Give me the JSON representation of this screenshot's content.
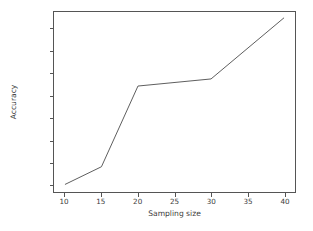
{
  "chart_data": {
    "type": "line",
    "title": "",
    "xlabel": "Sampling size",
    "ylabel": "Accuracy",
    "x": [
      10,
      15,
      20,
      30,
      40
    ],
    "values": [
      84.2,
      84.22,
      84.311,
      84.319,
      84.388
    ],
    "series": [
      {
        "name": "accuracy",
        "x": [
          10,
          15,
          20,
          30,
          40
        ],
        "values": [
          84.2,
          84.22,
          84.311,
          84.319,
          84.388
        ]
      }
    ],
    "xlim": [
      8.5,
      41.5
    ],
    "ylim": [
      84.1915,
      84.3945
    ],
    "xticks": [
      10,
      15,
      20,
      25,
      30,
      35,
      40
    ],
    "xtick_labels": [
      "10",
      "15",
      "20",
      "25",
      "30",
      "35",
      "40"
    ],
    "yticks": [
      84.2,
      84.225,
      84.25,
      84.275,
      84.3,
      84.325,
      84.35,
      84.375
    ],
    "ytick_labels": [
      "84.200",
      "84.225",
      "84.250",
      "84.275",
      "84.300",
      "84.325",
      "84.350",
      "84.375"
    ],
    "grid": false,
    "legend": null,
    "legend_position": "none",
    "line_color": "#4a4a4a",
    "line_width": 0.9,
    "marker": "none",
    "background_color": "#ffffff",
    "axis_color": "#555555",
    "text_color": "#3b3b3b"
  }
}
